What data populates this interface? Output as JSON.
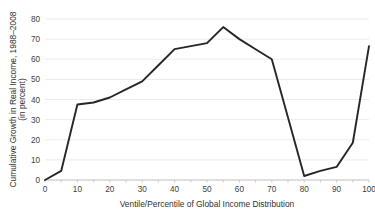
{
  "chart_data": {
    "type": "line",
    "title": "",
    "xlabel": "Ventile/Percentile of Global Income Distribution",
    "ylabel": "Cumulative Growth in Real Income, 1988–2008 (in percent)",
    "ylabel_line1": "Cumulative Growth in Real Income, 1988–2008",
    "ylabel_line2": "(in percent)",
    "xlim": [
      0,
      100
    ],
    "ylim": [
      0,
      80
    ],
    "xticks": [
      0,
      10,
      20,
      30,
      40,
      50,
      60,
      70,
      80,
      90,
      100
    ],
    "xtick_labels": [
      "0",
      "10",
      "20",
      "30",
      "40",
      "50",
      "60",
      "70",
      "80",
      "90",
      "100"
    ],
    "xminor_step": 5,
    "yticks": [
      0,
      10,
      20,
      30,
      40,
      50,
      60,
      70,
      80
    ],
    "ytick_labels": [
      "0",
      "10",
      "20",
      "30",
      "40",
      "50",
      "60",
      "70",
      "80"
    ],
    "grid": "horizontal",
    "legend": "none",
    "line_color": "#262626",
    "grid_color": "#e2e2e2",
    "axis_color": "#bdbdbd",
    "series": [
      {
        "name": "Cumulative real income growth 1988–2008",
        "x": [
          0,
          5,
          10,
          15,
          20,
          25,
          30,
          35,
          40,
          45,
          50,
          55,
          60,
          65,
          70,
          75,
          80,
          85,
          90,
          95,
          100
        ],
        "values": [
          0,
          4.5,
          37.5,
          38.5,
          41,
          45,
          49,
          57,
          65,
          66.5,
          68,
          76,
          70,
          65,
          60,
          31,
          2,
          4.5,
          6.5,
          18.5,
          66.5
        ]
      }
    ]
  }
}
